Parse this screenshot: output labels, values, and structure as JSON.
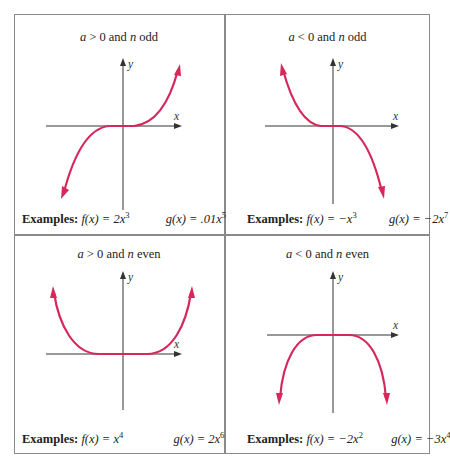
{
  "figure": {
    "top_caption_fragment": "",
    "frame_color": "#8a8a8a",
    "curve_color": "#d6285a",
    "axis_labels": {
      "x": "x",
      "y": "y"
    },
    "examples_label": "Examples:",
    "panels": [
      {
        "id": "a-pos-n-odd",
        "condition": {
          "a": "a",
          "sign": " > 0 and ",
          "n": "n",
          "parity": " odd"
        },
        "f": {
          "name": "f(x) = ",
          "body": "2x",
          "exp": "3"
        },
        "g": {
          "name": "g(x) = ",
          "body": ".01x",
          "exp": "5"
        },
        "shape": "rises right, falls left (cubic-like)"
      },
      {
        "id": "a-neg-n-odd",
        "condition": {
          "a": "a",
          "sign": " < 0 and ",
          "n": "n",
          "parity": " odd"
        },
        "f": {
          "name": "f(x) = ",
          "body": "−x",
          "exp": "3"
        },
        "g": {
          "name": "g(x) = ",
          "body": "−2x",
          "exp": "7"
        },
        "shape": "rises left, falls right (negative cubic-like)"
      },
      {
        "id": "a-pos-n-even",
        "condition": {
          "a": "a",
          "sign": " > 0 and ",
          "n": "n",
          "parity": " even"
        },
        "f": {
          "name": "f(x) = ",
          "body": "x",
          "exp": "4"
        },
        "g": {
          "name": "g(x) = ",
          "body": "2x",
          "exp": "6"
        },
        "shape": "rises both ends (U-shape)"
      },
      {
        "id": "a-neg-n-even",
        "condition": {
          "a": "a",
          "sign": " < 0 and ",
          "n": "n",
          "parity": " even"
        },
        "f": {
          "name": "f(x) = ",
          "body": "−2x",
          "exp": "2"
        },
        "g": {
          "name": "g(x) = ",
          "body": "−3x",
          "exp": "4"
        },
        "shape": "falls both ends (inverted U-shape)"
      }
    ]
  }
}
